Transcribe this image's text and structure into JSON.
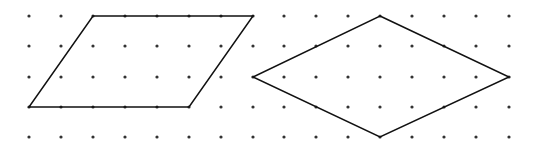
{
  "diagram": {
    "type": "dot-grid-shapes",
    "background": "#ffffff",
    "dot_color": "#333333",
    "line_color": "#111111",
    "grid": {
      "columns_x": [
        29,
        61,
        93,
        125,
        157,
        189,
        221,
        253,
        284,
        316,
        348,
        380,
        412,
        444,
        476,
        509
      ],
      "rows_y": [
        16,
        46,
        77,
        107,
        137
      ],
      "dot_radius": 1.6
    },
    "shapes": [
      {
        "name": "parallelogram",
        "points": [
          [
            93,
            16
          ],
          [
            253,
            16
          ],
          [
            189,
            107
          ],
          [
            29,
            107
          ]
        ]
      },
      {
        "name": "rhombus",
        "points": [
          [
            380,
            16
          ],
          [
            509,
            77
          ],
          [
            380,
            137
          ],
          [
            253,
            77
          ]
        ]
      }
    ]
  }
}
